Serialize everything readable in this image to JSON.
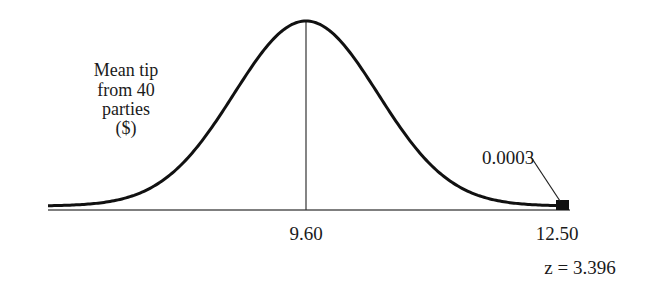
{
  "chart_data": {
    "type": "area",
    "title": "",
    "ylabel_lines": [
      "Mean tip",
      "from 40",
      "parties",
      "($)"
    ],
    "xlabel": "",
    "distribution": {
      "kind": "normal",
      "mean": 9.6
    },
    "x_ticks": [
      {
        "value": 9.6,
        "label": "9.60"
      },
      {
        "value": 12.5,
        "label": "12.50"
      }
    ],
    "annotations": {
      "tail_probability": "0.0003",
      "z_score": "z = 3.396"
    },
    "shaded_region": {
      "from": 12.5,
      "to": "inf",
      "area": 0.0003
    },
    "grid": false,
    "legend": null
  },
  "colors": {
    "curve": "#111111",
    "axis": "#555555",
    "mean_line": "#333333",
    "shade": "#111111"
  }
}
